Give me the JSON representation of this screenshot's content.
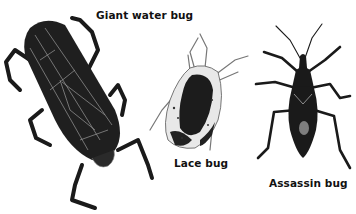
{
  "figure": {
    "labels": {
      "giant_water_bug": "Giant water bug",
      "lace_bug": "Lace bug",
      "assassin_bug": "Assassin bug"
    },
    "colors": {
      "background": "#ffffff",
      "bug_body": "#1a1a1a",
      "bug_highlight": "#8a8a8a",
      "label_text": "#111111"
    }
  }
}
